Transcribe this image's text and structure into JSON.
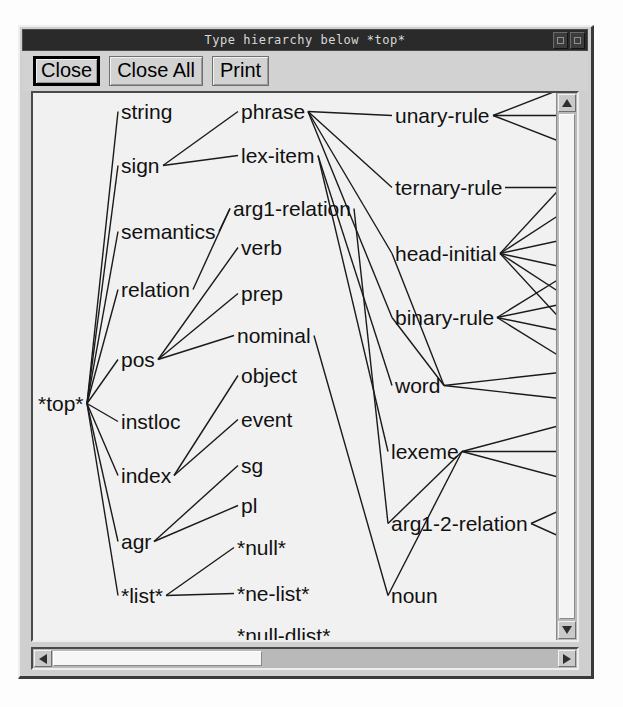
{
  "window": {
    "title": "Type hierarchy below *top*",
    "controls": [
      {
        "name": "minimize-button",
        "glyph": "box"
      },
      {
        "name": "maximize-button",
        "glyph": "box"
      }
    ]
  },
  "toolbar": {
    "buttons": [
      {
        "label": "Close",
        "name": "close-button",
        "default": true
      },
      {
        "label": "Close All",
        "name": "close-all-button",
        "default": false
      },
      {
        "label": "Print",
        "name": "print-button",
        "default": false
      }
    ]
  },
  "scrollbars": {
    "vertical": {
      "up_icon": "triangle-up-icon",
      "down_icon": "triangle-down-icon"
    },
    "horizontal": {
      "left_icon": "triangle-left-icon",
      "right_icon": "triangle-right-icon"
    }
  },
  "graph": {
    "root": "*top*",
    "nodes": [
      {
        "id": "top",
        "label": "*top*",
        "x": 5,
        "y": 300
      },
      {
        "id": "string",
        "label": "string",
        "x": 88,
        "y": 8
      },
      {
        "id": "sign",
        "label": "sign",
        "x": 88,
        "y": 62
      },
      {
        "id": "semantics",
        "label": "semantics",
        "x": 88,
        "y": 128
      },
      {
        "id": "relation",
        "label": "relation",
        "x": 88,
        "y": 186
      },
      {
        "id": "pos",
        "label": "pos",
        "x": 88,
        "y": 256
      },
      {
        "id": "instloc",
        "label": "instloc",
        "x": 88,
        "y": 318
      },
      {
        "id": "index",
        "label": "index",
        "x": 88,
        "y": 372
      },
      {
        "id": "agr",
        "label": "agr",
        "x": 88,
        "y": 438
      },
      {
        "id": "list",
        "label": "*list*",
        "x": 88,
        "y": 492
      },
      {
        "id": "phrase",
        "label": "phrase",
        "x": 208,
        "y": 8
      },
      {
        "id": "lex-item",
        "label": "lex-item",
        "x": 208,
        "y": 52
      },
      {
        "id": "arg1-relation",
        "label": "arg1-relation",
        "x": 200,
        "y": 105
      },
      {
        "id": "verb",
        "label": "verb",
        "x": 208,
        "y": 144
      },
      {
        "id": "prep",
        "label": "prep",
        "x": 208,
        "y": 190
      },
      {
        "id": "nominal",
        "label": "nominal",
        "x": 204,
        "y": 232
      },
      {
        "id": "object",
        "label": "object",
        "x": 208,
        "y": 272
      },
      {
        "id": "event",
        "label": "event",
        "x": 208,
        "y": 316
      },
      {
        "id": "sg",
        "label": "sg",
        "x": 208,
        "y": 362
      },
      {
        "id": "pl",
        "label": "pl",
        "x": 208,
        "y": 402
      },
      {
        "id": "null",
        "label": "*null*",
        "x": 204,
        "y": 444
      },
      {
        "id": "ne-list",
        "label": "*ne-list*",
        "x": 204,
        "y": 490
      },
      {
        "id": "null-dlist",
        "label": "*null-dlist*",
        "x": 204,
        "y": 532
      },
      {
        "id": "unary-rule",
        "label": "unary-rule",
        "x": 362,
        "y": 12
      },
      {
        "id": "ternary-rule",
        "label": "ternary-rule",
        "x": 362,
        "y": 84
      },
      {
        "id": "head-initial",
        "label": "head-initial",
        "x": 362,
        "y": 150
      },
      {
        "id": "binary-rule",
        "label": "binary-rule",
        "x": 362,
        "y": 214
      },
      {
        "id": "word",
        "label": "word",
        "x": 362,
        "y": 282
      },
      {
        "id": "lexeme",
        "label": "lexeme",
        "x": 358,
        "y": 348
      },
      {
        "id": "arg1-2-relation",
        "label": "arg1-2-relation",
        "x": 358,
        "y": 420
      },
      {
        "id": "noun",
        "label": "noun",
        "x": 358,
        "y": 492
      }
    ],
    "edges": [
      [
        "top",
        "string"
      ],
      [
        "top",
        "sign"
      ],
      [
        "top",
        "semantics"
      ],
      [
        "top",
        "relation"
      ],
      [
        "top",
        "pos"
      ],
      [
        "top",
        "instloc"
      ],
      [
        "top",
        "index"
      ],
      [
        "top",
        "agr"
      ],
      [
        "top",
        "list"
      ],
      [
        "sign",
        "phrase"
      ],
      [
        "sign",
        "lex-item"
      ],
      [
        "semantics",
        "arg1-relation"
      ],
      [
        "relation",
        "arg1-relation"
      ],
      [
        "pos",
        "verb"
      ],
      [
        "pos",
        "prep"
      ],
      [
        "pos",
        "nominal"
      ],
      [
        "index",
        "object"
      ],
      [
        "index",
        "event"
      ],
      [
        "agr",
        "sg"
      ],
      [
        "agr",
        "pl"
      ],
      [
        "list",
        "null"
      ],
      [
        "list",
        "ne-list"
      ],
      [
        "phrase",
        "unary-rule"
      ],
      [
        "phrase",
        "ternary-rule"
      ],
      [
        "phrase",
        "binary-rule"
      ],
      [
        "phrase",
        "head-initial"
      ],
      [
        "lex-item",
        "word"
      ],
      [
        "lex-item",
        "lexeme"
      ],
      [
        "arg1-relation",
        "arg1-2-relation"
      ],
      [
        "nominal",
        "noun"
      ],
      [
        "word",
        "head-initial"
      ],
      [
        "word",
        "binary-rule"
      ],
      [
        "lexeme",
        "noun"
      ],
      [
        "lexeme",
        "arg1-2-relation"
      ]
    ]
  }
}
